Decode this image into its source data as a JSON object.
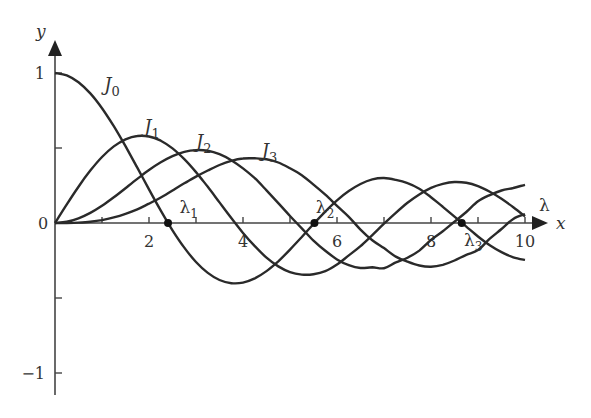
{
  "chart_data": {
    "type": "line",
    "title": "",
    "xlabel": "x",
    "ylabel": "y",
    "xlim": [
      0,
      10.5
    ],
    "ylim": [
      -1.05,
      1.2
    ],
    "grid": false,
    "legend": "inline curve labels",
    "x_ticks": [
      1,
      2,
      3,
      4,
      5,
      6,
      7,
      8,
      9,
      10
    ],
    "x_tick_labels": [
      {
        "x": 2,
        "label": "2"
      },
      {
        "x": 4,
        "label": "4"
      },
      {
        "x": 6,
        "label": "6"
      },
      {
        "x": 8,
        "label": "8"
      },
      {
        "x": 10,
        "label": "10"
      }
    ],
    "y_ticks": [
      1,
      0.5,
      -0.5,
      -1
    ],
    "y_tick_labels": [
      {
        "y": 1,
        "label": "1"
      },
      {
        "y": 0,
        "label": "0"
      },
      {
        "y": -1,
        "label": "−1"
      }
    ],
    "x": [
      0,
      0.25,
      0.5,
      0.75,
      1,
      1.25,
      1.5,
      1.75,
      2,
      2.25,
      2.5,
      2.75,
      3,
      3.25,
      3.5,
      3.75,
      4,
      4.25,
      4.5,
      4.75,
      5,
      5.25,
      5.5,
      5.75,
      6,
      6.25,
      6.5,
      6.75,
      7,
      7.25,
      7.5,
      7.75,
      8,
      8.25,
      8.5,
      8.75,
      9,
      9.25,
      9.5,
      9.75,
      10
    ],
    "series": [
      {
        "name": "J0",
        "label": "J",
        "sub": "0",
        "label_pos": [
          1.05,
          0.88
        ],
        "values": [
          1,
          0.9844,
          0.9385,
          0.8642,
          0.7652,
          0.6459,
          0.5118,
          0.369,
          0.2239,
          0.0827,
          -0.0484,
          -0.1641,
          -0.2601,
          -0.3328,
          -0.3801,
          -0.4014,
          -0.3971,
          -0.3691,
          -0.3205,
          -0.2551,
          -0.1776,
          -0.0931,
          -0.0068,
          0.0759,
          0.1506,
          0.2127,
          0.2601,
          0.2906,
          0.3001,
          0.2875,
          0.2663,
          0.2284,
          0.1717,
          0.1078,
          0.0419,
          -0.0238,
          -0.0903,
          -0.148,
          -0.1939,
          -0.2286,
          -0.2459
        ]
      },
      {
        "name": "J1",
        "label": "J",
        "sub": "1",
        "label_pos": [
          1.9,
          0.6
        ],
        "values": [
          0,
          0.124,
          0.2423,
          0.3492,
          0.4401,
          0.5106,
          0.5579,
          0.5802,
          0.5767,
          0.5484,
          0.4971,
          0.426,
          0.3391,
          0.2411,
          0.1374,
          0.0332,
          -0.066,
          -0.1538,
          -0.2311,
          -0.2892,
          -0.3276,
          -0.3437,
          -0.3414,
          -0.321,
          -0.2767,
          -0.2159,
          -0.1538,
          -0.0806,
          -0.0047,
          0.0682,
          0.1352,
          0.1906,
          0.2346,
          0.2612,
          0.2731,
          0.2679,
          0.2453,
          0.2083,
          0.1613,
          0.1047,
          0.0435
        ]
      },
      {
        "name": "J2",
        "label": "J",
        "sub": "2",
        "label_pos": [
          3.0,
          0.5
        ],
        "values": [
          0,
          0.0078,
          0.0306,
          0.0671,
          0.1149,
          0.1711,
          0.2321,
          0.294,
          0.3528,
          0.4047,
          0.4461,
          0.4739,
          0.4861,
          0.4817,
          0.4586,
          0.4186,
          0.3641,
          0.2984,
          0.2178,
          0.1328,
          0.0466,
          -0.0353,
          -0.1173,
          -0.185,
          -0.2429,
          -0.2806,
          -0.3001,
          -0.2955,
          -0.3014,
          -0.2624,
          -0.2313,
          -0.1837,
          -0.113,
          -0.0553,
          0.0087,
          0.0732,
          0.1448,
          0.1862,
          0.2167,
          0.2335,
          0.2546
        ]
      },
      {
        "name": "J3",
        "label": "J",
        "sub": "3",
        "label_pos": [
          4.4,
          0.44
        ],
        "values": [
          0,
          0.0003,
          0.0026,
          0.0085,
          0.0196,
          0.0373,
          0.061,
          0.0907,
          0.1289,
          0.1698,
          0.2166,
          0.2647,
          0.3091,
          0.3499,
          0.3868,
          0.4139,
          0.4302,
          0.431,
          0.4247,
          0.4032,
          0.3648,
          0.3185,
          0.2561,
          0.1888,
          0.1148,
          0.0415,
          -0.0443,
          -0.1149,
          -0.1676,
          -0.2242,
          -0.2581,
          -0.2835,
          -0.2911,
          -0.2785,
          -0.25,
          -0.2119,
          -0.1809,
          -0.1048,
          -0.0401,
          0.027,
          0.0584
        ]
      }
    ],
    "annotations": [
      {
        "text": "λ",
        "sub": "1",
        "x": 2.405,
        "y": 0,
        "label_pos": [
          2.65,
          0.07
        ]
      },
      {
        "text": "λ",
        "sub": "2",
        "x": 5.52,
        "y": 0,
        "label_pos": [
          5.55,
          0.07
        ]
      },
      {
        "text": "λ",
        "sub": "3",
        "x": 8.654,
        "y": 0,
        "label_pos": [
          8.7,
          -0.15
        ]
      },
      {
        "text": "λ",
        "sub": "",
        "x": 10.1,
        "y": 0.1,
        "label_pos": [
          10.3,
          0.08
        ]
      }
    ]
  },
  "frame": {
    "origin_px": [
      55,
      223
    ],
    "px_per_x": 47,
    "px_per_y": 150,
    "x_axis_end_px": 548,
    "y_axis_top_px": 40,
    "y_axis_bottom_px": 395
  },
  "labels": {
    "x_axis": "x",
    "y_axis": "y",
    "zero": "0"
  }
}
